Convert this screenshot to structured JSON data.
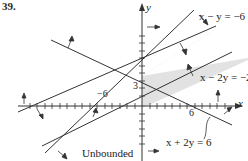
{
  "problem_number": "39.",
  "axes": {
    "x_label": "x",
    "y_label": "y",
    "tick_labels": {
      "neg6": "−6",
      "pos6": "6",
      "pos3": "3"
    }
  },
  "lines": [
    {
      "equation": "x − y = −6"
    },
    {
      "equation": "x − 2y = −2"
    },
    {
      "equation": "x + 2y = 6"
    }
  ],
  "region_label": "Unbounded",
  "colors": {
    "shade": "#e2e2e2",
    "line": "#333333"
  }
}
